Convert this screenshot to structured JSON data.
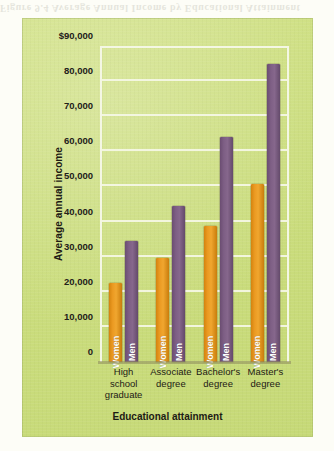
{
  "page": {
    "bleed_text": "Figure 9.4  Average Annual Income by Educational Attainment"
  },
  "colors": {
    "panel_background": "#CBDD7D",
    "women_bar": "#E8921B",
    "men_bar": "#7A5A80",
    "gridline": "#F4F7E4",
    "text": "#1D1A14"
  },
  "chart_data": {
    "type": "bar",
    "title": "",
    "xlabel": "Educational attainment",
    "ylabel": "Average annual income",
    "categories": [
      "High school graduate",
      "Associate degree",
      "Bachelor's degree",
      "Master's degree"
    ],
    "category_lines": [
      [
        "High",
        "school",
        "graduate"
      ],
      [
        "Associate",
        "degree"
      ],
      [
        "Bachelor's",
        "degree"
      ],
      [
        "Master's",
        "degree"
      ]
    ],
    "series": [
      {
        "name": "Women",
        "color": "#E8921B",
        "values": [
          22500,
          29700,
          38800,
          50800
        ]
      },
      {
        "name": "Men",
        "color": "#7A5A80",
        "values": [
          34500,
          44300,
          64000,
          85000
        ]
      }
    ],
    "ylim": [
      0,
      90000
    ],
    "ytick_values": [
      90000,
      80000,
      70000,
      60000,
      50000,
      40000,
      30000,
      20000,
      10000,
      0
    ],
    "ytick_labels": [
      "$90,000",
      "80,000",
      "70,000",
      "60,000",
      "50,000",
      "40,000",
      "30,000",
      "20,000",
      "10,000",
      "0"
    ],
    "grid": true,
    "grid_axis": "y",
    "legend_position": "in-bar-labels"
  }
}
